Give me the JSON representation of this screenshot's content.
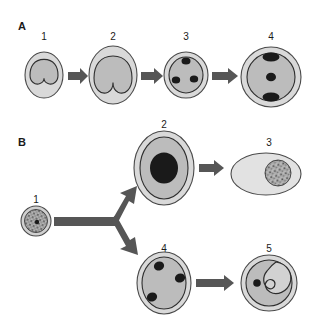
{
  "figure": {
    "width": 317,
    "height": 319,
    "background": "#ffffff"
  },
  "palette": {
    "outer_wall": "#d9d9d9",
    "outer_wall_stroke": "#3a3a3a",
    "cytoplasm": "#bcbcbc",
    "cytoplasm_stroke": "#2e2e2e",
    "nucleus_dark": "#1a1a1a",
    "arrow": "#565656",
    "label_text": "#1a1a1a",
    "pale_cell": "#e2e2e2",
    "spore_fill": "#a8a8a8"
  },
  "panels": [
    {
      "id": "panel-a",
      "letter": "A",
      "letter_x": 18,
      "letter_y": 30,
      "stages": [
        {
          "id": "a1",
          "number": "1",
          "number_x": 44,
          "number_y": 40,
          "cx": 44,
          "cy": 75,
          "type": "bilobed-cell",
          "rx_outer": 19,
          "ry_outer": 23,
          "rx_inner": 14,
          "ry_inner": 18
        },
        {
          "id": "a2",
          "number": "2",
          "number_x": 113,
          "number_y": 40,
          "cx": 113,
          "cy": 75,
          "type": "bilobed-cell",
          "rx_outer": 24,
          "ry_outer": 29,
          "rx_inner": 19,
          "ry_inner": 24
        },
        {
          "id": "a3",
          "number": "3",
          "number_x": 186,
          "number_y": 40,
          "cx": 186,
          "cy": 75,
          "type": "three-nuclei-round",
          "rx_outer": 22,
          "ry_outer": 23,
          "rx_inner": 17,
          "ry_inner": 18,
          "nuclei": [
            {
              "cx": 186,
              "cy": 61,
              "rx": 4.5,
              "ry": 3.5
            },
            {
              "cx": 175,
              "cy": 80,
              "rx": 4.2,
              "ry": 3.6
            },
            {
              "cx": 194,
              "cy": 79,
              "rx": 4.2,
              "ry": 3.6
            }
          ]
        },
        {
          "id": "a4",
          "number": "4",
          "number_x": 271,
          "number_y": 40,
          "cx": 271,
          "cy": 77,
          "type": "three-nuclei-round",
          "rx_outer": 30,
          "ry_outer": 30,
          "rx_inner": 24,
          "ry_inner": 24,
          "nuclei": [
            {
              "cx": 271,
              "cy": 57,
              "rx": 8.5,
              "ry": 4.5
            },
            {
              "cx": 271,
              "cy": 77,
              "rx": 5.0,
              "ry": 4.2
            },
            {
              "cx": 271,
              "cy": 97,
              "rx": 8.5,
              "ry": 4.5
            }
          ]
        }
      ],
      "arrows": [
        {
          "id": "a-arrow-1",
          "x1": 68,
          "y1": 76,
          "x2": 86,
          "y2": 76
        },
        {
          "id": "a-arrow-2",
          "x1": 141,
          "y1": 76,
          "x2": 161,
          "y2": 76
        },
        {
          "id": "a-arrow-3",
          "x1": 211,
          "y1": 76,
          "x2": 237,
          "y2": 76
        }
      ]
    },
    {
      "id": "panel-b",
      "letter": "B",
      "letter_x": 18,
      "letter_y": 146,
      "stages": [
        {
          "id": "b1",
          "number": "1",
          "number_x": 36,
          "number_y": 202,
          "cx": 36,
          "cy": 221,
          "type": "textured-spore",
          "rx_outer": 15,
          "ry_outer": 15,
          "rx_inner": 11,
          "ry_inner": 11,
          "has_center_dot": true
        },
        {
          "id": "b2",
          "number": "2",
          "number_x": 164,
          "number_y": 128,
          "cx": 164,
          "cy": 168,
          "type": "large-dark-nucleus",
          "rx_outer": 30,
          "ry_outer": 37,
          "rx_inner": 24,
          "ry_inner": 31,
          "nucleus": {
            "cx": 164,
            "cy": 168,
            "rx": 14,
            "ry": 15
          }
        },
        {
          "id": "b3",
          "number": "3",
          "number_x": 269,
          "number_y": 146,
          "cx": 266,
          "cy": 174,
          "type": "pale-oval-with-spore",
          "rx_outer": 35,
          "ry_outer": 21,
          "spore": {
            "cx": 278,
            "cy": 173,
            "rx": 13,
            "ry": 13
          }
        },
        {
          "id": "b4",
          "number": "4",
          "number_x": 164,
          "number_y": 252,
          "cx": 164,
          "cy": 283,
          "type": "three-nuclei-oval",
          "rx_outer": 27,
          "ry_outer": 31,
          "rx_inner": 22,
          "ry_inner": 26,
          "nuclei": [
            {
              "cx": 159,
              "cy": 266,
              "rx": 5.0,
              "ry": 4.2
            },
            {
              "cx": 179,
              "cy": 278,
              "rx": 5.0,
              "ry": 4.2
            },
            {
              "cx": 153,
              "cy": 296,
              "rx": 5.0,
              "ry": 4.2
            }
          ]
        },
        {
          "id": "b5",
          "number": "5",
          "number_x": 269,
          "number_y": 252,
          "cx": 269,
          "cy": 283,
          "type": "embryo-comma",
          "rx_outer": 28,
          "ry_outer": 28,
          "rx_inner": 23,
          "ry_inner": 23,
          "dot": {
            "cx": 257,
            "cy": 283,
            "rx": 3.8,
            "ry": 3.8
          }
        }
      ],
      "arrows": [
        {
          "id": "b-arrow-stem",
          "x1": 55,
          "y1": 222,
          "x2": 118,
          "y2": 222
        },
        {
          "id": "b-arrow-up",
          "x1": 118,
          "y1": 222,
          "x2": 133,
          "y2": 195
        },
        {
          "id": "b-arrow-down",
          "x1": 118,
          "y1": 222,
          "x2": 136,
          "y2": 256
        },
        {
          "id": "b-arrow-2-to-3",
          "x1": 199,
          "y1": 168,
          "x2": 225,
          "y2": 168
        },
        {
          "id": "b-arrow-4-to-5",
          "x1": 196,
          "y1": 283,
          "x2": 235,
          "y2": 283
        }
      ]
    }
  ]
}
